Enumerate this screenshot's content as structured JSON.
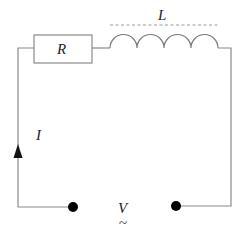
{
  "diagram": {
    "type": "RL circuit (AC source)",
    "components": {
      "resistor": {
        "label": "R"
      },
      "inductor": {
        "label": "L"
      },
      "current": {
        "label": "I"
      },
      "source": {
        "label": "V",
        "symbol": "~"
      }
    },
    "colors": {
      "wire": "#8a8a8a",
      "terminal": "#000000",
      "text": "#222222"
    }
  }
}
